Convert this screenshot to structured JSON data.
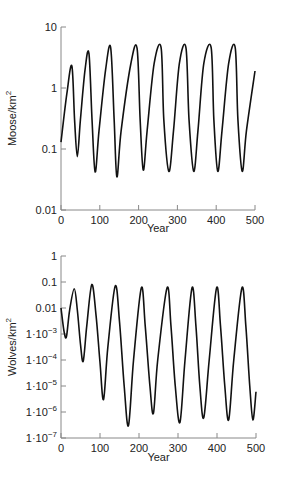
{
  "chart_data": [
    {
      "type": "line",
      "title": "",
      "xlabel": "Year",
      "ylabel": "Moose/km²",
      "ylabel_base": "Moose/km",
      "ylabel_sup": "2",
      "yscale": "log",
      "xlim": [
        0,
        500
      ],
      "ylim": [
        0.01,
        10
      ],
      "grid": false,
      "x_ticks": [
        "0",
        "100",
        "200",
        "300",
        "400",
        "500"
      ],
      "y_ticks": [
        {
          "value": 10,
          "base": "10",
          "exp": ""
        },
        {
          "value": 1,
          "base": "1",
          "exp": ""
        },
        {
          "value": 0.1,
          "base": "0.1",
          "exp": ""
        },
        {
          "value": 0.01,
          "base": "0.01",
          "exp": ""
        }
      ],
      "series": [
        {
          "name": "Moose",
          "points": [
            [
              0,
              0.13
            ],
            [
              15,
              0.8
            ],
            [
              28,
              2.3
            ],
            [
              35,
              0.3
            ],
            [
              42,
              0.075
            ],
            [
              50,
              0.3
            ],
            [
              62,
              2.0
            ],
            [
              72,
              3.7
            ],
            [
              80,
              0.3
            ],
            [
              88,
              0.042
            ],
            [
              98,
              0.2
            ],
            [
              115,
              2.0
            ],
            [
              128,
              4.6
            ],
            [
              137,
              0.3
            ],
            [
              144,
              0.035
            ],
            [
              155,
              0.2
            ],
            [
              180,
              2.5
            ],
            [
              196,
              4.5
            ],
            [
              204,
              0.3
            ],
            [
              212,
              0.045
            ],
            [
              222,
              0.2
            ],
            [
              240,
              2.5
            ],
            [
              258,
              4.6
            ],
            [
              265,
              0.3
            ],
            [
              278,
              0.043
            ],
            [
              290,
              0.2
            ],
            [
              305,
              2.5
            ],
            [
              322,
              4.6
            ],
            [
              330,
              0.3
            ],
            [
              342,
              0.043
            ],
            [
              353,
              0.2
            ],
            [
              368,
              2.5
            ],
            [
              387,
              4.6
            ],
            [
              394,
              0.3
            ],
            [
              404,
              0.043
            ],
            [
              415,
              0.2
            ],
            [
              432,
              2.5
            ],
            [
              449,
              4.6
            ],
            [
              456,
              0.3
            ],
            [
              467,
              0.043
            ],
            [
              478,
              0.2
            ],
            [
              500,
              1.9
            ]
          ]
        }
      ]
    },
    {
      "type": "line",
      "title": "",
      "xlabel": "Year",
      "ylabel": "Wolves/km²",
      "ylabel_base": "Wolves/km",
      "ylabel_sup": "2",
      "yscale": "log",
      "xlim": [
        0,
        500
      ],
      "ylim": [
        1e-07,
        1
      ],
      "grid": false,
      "x_ticks": [
        "0",
        "100",
        "200",
        "300",
        "400",
        "500"
      ],
      "y_ticks": [
        {
          "value": 1,
          "base": "1",
          "exp": ""
        },
        {
          "value": 0.1,
          "base": "0.1",
          "exp": ""
        },
        {
          "value": 0.01,
          "base": "0.01",
          "exp": ""
        },
        {
          "value": 0.001,
          "base": "1·10",
          "exp": "−3"
        },
        {
          "value": 0.0001,
          "base": "1·10",
          "exp": "−4"
        },
        {
          "value": 1e-05,
          "base": "1·10",
          "exp": "−5"
        },
        {
          "value": 1e-06,
          "base": "1·10",
          "exp": "−6"
        },
        {
          "value": 1e-07,
          "base": "1·10",
          "exp": "−7"
        }
      ],
      "series": [
        {
          "name": "Wolves",
          "points": [
            [
              0,
              0.01
            ],
            [
              8,
              0.0012
            ],
            [
              14,
              0.0008
            ],
            [
              22,
              0.008
            ],
            [
              34,
              0.055
            ],
            [
              42,
              0.008
            ],
            [
              50,
              0.0004
            ],
            [
              57,
              9e-05
            ],
            [
              66,
              0.002
            ],
            [
              79,
              0.08
            ],
            [
              90,
              0.005
            ],
            [
              100,
              8e-05
            ],
            [
              109,
              3e-06
            ],
            [
              120,
              0.0003
            ],
            [
              139,
              0.07
            ],
            [
              150,
              0.003
            ],
            [
              162,
              1e-05
            ],
            [
              173,
              3e-07
            ],
            [
              186,
              0.0001
            ],
            [
              206,
              0.06
            ],
            [
              216,
              0.002
            ],
            [
              228,
              1e-05
            ],
            [
              237,
              9e-07
            ],
            [
              248,
              0.0001
            ],
            [
              272,
              0.06
            ],
            [
              282,
              0.002
            ],
            [
              293,
              1e-05
            ],
            [
              305,
              4e-07
            ],
            [
              318,
              0.0001
            ],
            [
              336,
              0.06
            ],
            [
              346,
              0.002
            ],
            [
              356,
              1e-05
            ],
            [
              366,
              6e-07
            ],
            [
              380,
              0.0001
            ],
            [
              399,
              0.06
            ],
            [
              409,
              0.002
            ],
            [
              420,
              1e-05
            ],
            [
              430,
              5e-07
            ],
            [
              443,
              0.0001
            ],
            [
              464,
              0.06
            ],
            [
              474,
              0.002
            ],
            [
              484,
              1e-05
            ],
            [
              492,
              5e-07
            ],
            [
              500,
              6e-06
            ]
          ]
        }
      ]
    }
  ],
  "layout": {
    "panels": [
      {
        "left": 61,
        "right": 255,
        "top": 27,
        "bottom": 210,
        "xlabel_y": 232
      },
      {
        "left": 61,
        "right": 256,
        "top": 256,
        "bottom": 438,
        "xlabel_y": 461
      }
    ]
  }
}
